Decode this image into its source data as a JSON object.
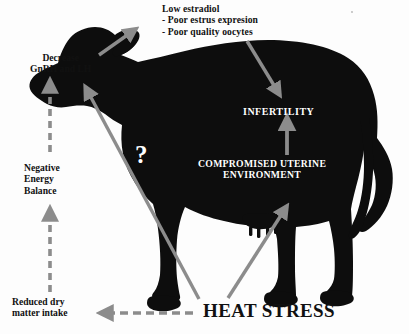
{
  "diagram": {
    "subject_icon": "cow-silhouette",
    "colors": {
      "background": "#fdfdfd",
      "silhouette": "#0d0d0d",
      "arrow_gray": "#8c8c8c",
      "text_dark": "#111111",
      "text_light": "#ffffff"
    },
    "labels": {
      "low_estradiol": {
        "line1": "Low estradiol",
        "line2": "- Poor estrus expresion",
        "line3": "- Poor quality oocytes"
      },
      "decrease_gnrh": {
        "line1": "Decrease",
        "line2": "GnRH and LH"
      },
      "negative_energy_balance": {
        "line1": "Negative",
        "line2": "Energy",
        "line3": "Balance"
      },
      "reduced_dry_matter_intake": {
        "line1": "Reduced dry",
        "line2": "matter intake"
      },
      "heat_stress": "HEAT STRESS",
      "infertility": "INFERTILITY",
      "compromised_uterine_environment": {
        "line1": "COMPROMISED UTERINE",
        "line2": "ENVIRONMENT"
      },
      "question_mark": "?"
    },
    "arrows": [
      {
        "name": "heat-stress-to-decrease-gnrh",
        "style": "solid",
        "color": "#8c8c8c",
        "from": "HEAT STRESS",
        "to": "Decrease GnRH and LH"
      },
      {
        "name": "heat-stress-to-reduced-dry-matter-intake",
        "style": "dashed",
        "color": "#8c8c8c",
        "from": "HEAT STRESS",
        "to": "Reduced dry matter intake"
      },
      {
        "name": "reduced-dry-matter-intake-to-negative-energy-balance",
        "style": "dashed",
        "color": "#8c8c8c",
        "from": "Reduced dry matter intake",
        "to": "Negative Energy Balance"
      },
      {
        "name": "negative-energy-balance-to-decrease-gnrh",
        "style": "dashed",
        "color": "#8c8c8c",
        "from": "Negative Energy Balance",
        "to": "Decrease GnRH and LH"
      },
      {
        "name": "decrease-gnrh-to-low-estradiol",
        "style": "solid",
        "color": "#8c8c8c",
        "from": "Decrease GnRH and LH",
        "to": "Low estradiol"
      },
      {
        "name": "low-estradiol-to-infertility",
        "style": "solid",
        "color": "#8c8c8c",
        "from": "Low estradiol",
        "to": "INFERTILITY"
      },
      {
        "name": "compromised-uterine-environment-to-infertility",
        "style": "solid",
        "color": "#8c8c8c",
        "from": "COMPROMISED UTERINE ENVIRONMENT",
        "to": "INFERTILITY"
      },
      {
        "name": "heat-stress-to-compromised-uterine-environment",
        "style": "solid",
        "color": "#8c8c8c",
        "from": "HEAT STRESS",
        "to": "COMPROMISED UTERINE ENVIRONMENT"
      }
    ]
  }
}
